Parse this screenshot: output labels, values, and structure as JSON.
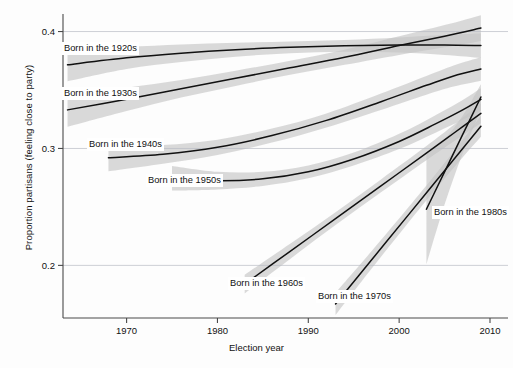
{
  "chart_data": {
    "type": "line",
    "title": "",
    "xlabel": "Election year",
    "ylabel": "Proportion partisans (feeling close to party)",
    "xlim": [
      1963,
      2010
    ],
    "ylim": [
      0.155,
      0.415
    ],
    "xticks": [
      1970,
      1980,
      1990,
      2000,
      2010
    ],
    "xticklabels": [
      "1970",
      "1980",
      "1990",
      "2000",
      "2010"
    ],
    "yticks": [
      0.2,
      0.3,
      0.4
    ],
    "yticklabels": [
      "0.2",
      "0.3",
      "0.4"
    ],
    "grid": "horizontal-only",
    "legend": "inline-labels",
    "band_color": "#c4c4c4",
    "line_color": "#111111",
    "series": [
      {
        "name": "Born in the 1920s",
        "label": "Born in the 1920s",
        "x": [
          1963.5,
          1970,
          1976,
          1982,
          1988,
          1994,
          2000,
          2005,
          2009
        ],
        "values": [
          0.3715,
          0.3775,
          0.3815,
          0.3845,
          0.3865,
          0.3878,
          0.3885,
          0.3885,
          0.388
        ],
        "band_lower": [
          0.3575,
          0.368,
          0.374,
          0.3785,
          0.3815,
          0.3828,
          0.382,
          0.38,
          0.3775
        ],
        "band_upper": [
          0.3855,
          0.387,
          0.389,
          0.3905,
          0.3915,
          0.3928,
          0.395,
          0.397,
          0.3985
        ]
      },
      {
        "name": "Born in the 1930s",
        "label": "Born in the 1930s",
        "x": [
          1963.5,
          1970,
          1976,
          1982,
          1988,
          1994,
          2000,
          2005,
          2009
        ],
        "values": [
          0.333,
          0.342,
          0.351,
          0.36,
          0.369,
          0.378,
          0.388,
          0.396,
          0.403
        ],
        "band_lower": [
          0.3185,
          0.332,
          0.3435,
          0.3535,
          0.363,
          0.3715,
          0.38,
          0.3865,
          0.392
        ],
        "band_upper": [
          0.347,
          0.352,
          0.3585,
          0.3665,
          0.375,
          0.3845,
          0.396,
          0.4055,
          0.414
        ]
      },
      {
        "name": "Born in the 1940s",
        "label": "Born in the 1940s",
        "x": [
          1968,
          1974,
          1980,
          1986,
          1992,
          1998,
          2003,
          2006,
          2009
        ],
        "values": [
          0.292,
          0.295,
          0.301,
          0.311,
          0.324,
          0.34,
          0.354,
          0.362,
          0.368
        ],
        "band_lower": [
          0.2805,
          0.287,
          0.2945,
          0.305,
          0.318,
          0.333,
          0.346,
          0.353,
          0.358
        ],
        "band_upper": [
          0.3035,
          0.303,
          0.3075,
          0.317,
          0.33,
          0.347,
          0.362,
          0.371,
          0.378
        ]
      },
      {
        "name": "Born in the 1950s",
        "label": "Born in the 1950s",
        "x": [
          1975,
          1980,
          1985,
          1990,
          1995,
          2000,
          2004,
          2007,
          2009
        ],
        "values": [
          0.2745,
          0.2725,
          0.274,
          0.28,
          0.291,
          0.306,
          0.321,
          0.333,
          0.342
        ],
        "band_lower": [
          0.264,
          0.265,
          0.268,
          0.2745,
          0.2855,
          0.2995,
          0.3135,
          0.3245,
          0.3325
        ],
        "band_upper": [
          0.285,
          0.28,
          0.28,
          0.2855,
          0.2965,
          0.3125,
          0.3285,
          0.3415,
          0.3515
        ]
      },
      {
        "name": "Born in the 1960s",
        "label": "Born in the 1960s",
        "x": [
          1983,
          1988,
          1993,
          1998,
          2003,
          2006,
          2009
        ],
        "values": [
          0.184,
          0.212,
          0.24,
          0.268,
          0.296,
          0.313,
          0.33
        ],
        "band_lower": [
          0.176,
          0.2055,
          0.2345,
          0.2625,
          0.29,
          0.306,
          0.3215
        ],
        "band_upper": [
          0.192,
          0.2185,
          0.2455,
          0.2735,
          0.302,
          0.32,
          0.3385
        ]
      },
      {
        "name": "Born in the 1970s",
        "label": "Born in the 1970s",
        "x": [
          1993,
          1997,
          2001,
          2004,
          2007,
          2009
        ],
        "values": [
          0.167,
          0.205,
          0.243,
          0.2715,
          0.3,
          0.319
        ],
        "band_lower": [
          0.1575,
          0.1975,
          0.2365,
          0.265,
          0.2925,
          0.31
        ],
        "band_upper": [
          0.1765,
          0.2125,
          0.2495,
          0.278,
          0.3075,
          0.328
        ]
      },
      {
        "name": "Born in the 1980s",
        "label": "Born in the 1980s",
        "x": [
          2003,
          2005,
          2007,
          2009
        ],
        "values": [
          0.248,
          0.28,
          0.312,
          0.344
        ],
        "band_lower": [
          0.201,
          0.252,
          0.296,
          0.333
        ],
        "band_upper": [
          0.295,
          0.308,
          0.328,
          0.355
        ]
      }
    ],
    "series_labels": [
      {
        "text": "Born in the 1920s",
        "left": 62,
        "top": 42
      },
      {
        "text": "Born in the 1930s",
        "left": 62,
        "top": 87
      },
      {
        "text": "Born in the 1940s",
        "left": 87,
        "top": 138
      },
      {
        "text": "Born in the 1950s",
        "left": 146,
        "top": 174
      },
      {
        "text": "Born in the 1960s",
        "left": 228,
        "top": 277
      },
      {
        "text": "Born in the 1970s",
        "left": 316,
        "top": 290
      },
      {
        "text": "Born in the 1980s",
        "left": 432,
        "top": 206
      }
    ]
  }
}
